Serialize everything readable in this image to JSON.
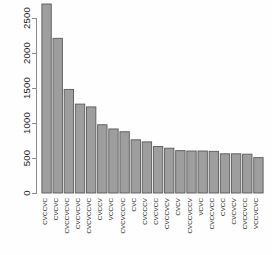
{
  "chart_data": {
    "type": "bar",
    "title": "",
    "subtitle": "",
    "xlabel": "",
    "ylabel": "",
    "grid": false,
    "legend": false,
    "orientation": "vertical",
    "bar_fill_color": "#9e9e9e",
    "bar_border_color": "#5a5a5a",
    "axis_color": "#8c8c8c",
    "background_color": "#ffffff",
    "xlim_note": "categorical",
    "ylim": [
      0,
      2600
    ],
    "ytick_values": [
      0,
      500,
      1000,
      1500,
      2000,
      2500
    ],
    "ytick_labels": [
      "0",
      "500",
      "1000",
      "1500",
      "2000",
      "2500"
    ],
    "xtick_rotation_degrees": 90,
    "categories": [
      "CVCCVC",
      "CVCVC",
      "CVCCVCVC",
      "CVCVCVC",
      "CVCVCCVC",
      "CVCCV",
      "VCCVC",
      "CVCVCCVC",
      "CVC",
      "CVCCCV",
      "CVCVCC",
      "CVCCVCV",
      "CVCV",
      "CVCCVCCV",
      "VCVC",
      "CVCCVCC",
      "CVCC",
      "CVCVCV",
      "CVCCVCC",
      "VCCVCVC"
    ],
    "values": [
      2700,
      2210,
      1480,
      1270,
      1230,
      975,
      915,
      875,
      760,
      730,
      665,
      640,
      605,
      600,
      600,
      595,
      560,
      560,
      555,
      505
    ]
  }
}
